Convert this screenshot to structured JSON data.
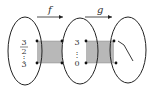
{
  "diagram": {
    "type": "function-composition-mapping",
    "colors": {
      "stroke": "#222222",
      "shade": "#b8b8b8",
      "text": "#333333",
      "background": "#ffffff"
    },
    "arrows": [
      {
        "label": "f",
        "from": "set-1",
        "to": "set-2"
      },
      {
        "label": "g",
        "from": "set-2",
        "to": "set-3"
      }
    ],
    "sets": [
      {
        "id": "set-1",
        "top_value_num": "3",
        "top_value_den": "2",
        "ellipsis": "⋮",
        "bottom_value": "3"
      },
      {
        "id": "set-2",
        "top_value": "3",
        "ellipsis": "⋮",
        "bottom_value": "0"
      },
      {
        "id": "set-3",
        "content": "bent-line"
      }
    ]
  }
}
